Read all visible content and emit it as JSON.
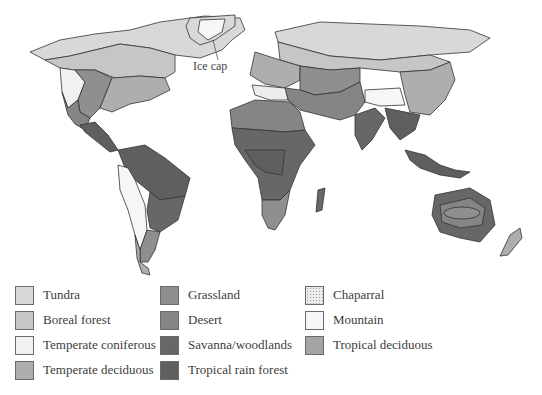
{
  "map": {
    "title": "World biome distribution map",
    "callouts": [
      {
        "label": "Ice cap"
      }
    ]
  },
  "legend": {
    "columns": [
      [
        {
          "label": "Tundra",
          "color": "#d8d8d8",
          "pattern": "solid"
        },
        {
          "label": "Boreal forest",
          "color": "#c6c6c6",
          "pattern": "solid"
        },
        {
          "label": "Temperate coniferous",
          "color": "#f1f1f1",
          "pattern": "solid"
        },
        {
          "label": "Temperate deciduous",
          "color": "#aeaeae",
          "pattern": "solid"
        }
      ],
      [
        {
          "label": "Grassland",
          "color": "#8f8f8f",
          "pattern": "solid"
        },
        {
          "label": "Desert",
          "color": "#858585",
          "pattern": "solid"
        },
        {
          "label": "Savanna/woodlands",
          "color": "#676767",
          "pattern": "solid"
        },
        {
          "label": "Tropical rain forest",
          "color": "#5f5f5f",
          "pattern": "solid"
        }
      ],
      [
        {
          "label": "Chaparral",
          "color": "#ececec",
          "pattern": "dotted"
        },
        {
          "label": "Mountain",
          "color": "#f6f6f6",
          "pattern": "solid"
        },
        {
          "label": "Tropical deciduous",
          "color": "#a4a4a4",
          "pattern": "solid"
        }
      ]
    ]
  }
}
